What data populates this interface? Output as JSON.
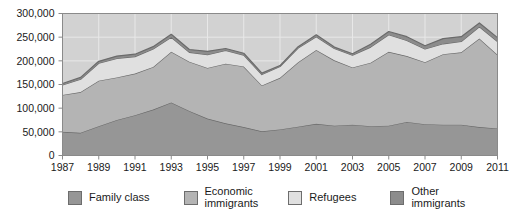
{
  "chart_data": {
    "type": "area",
    "stacked": true,
    "title": "",
    "xlabel": "",
    "ylabel": "",
    "grid": true,
    "legend_position": "bottom",
    "xlim": [
      1987,
      2011
    ],
    "ylim": [
      0,
      300000
    ],
    "ytick_values": [
      0,
      50000,
      100000,
      150000,
      200000,
      250000,
      300000
    ],
    "ytick_labels": [
      "0",
      "50,000",
      "100,000",
      "150,000",
      "200,000",
      "250,000",
      "300,000"
    ],
    "x": [
      1987,
      1988,
      1989,
      1990,
      1991,
      1992,
      1993,
      1994,
      1995,
      1996,
      1997,
      1998,
      1999,
      2000,
      2001,
      2002,
      2003,
      2004,
      2005,
      2006,
      2007,
      2008,
      2009,
      2010,
      2011
    ],
    "xtick_values": [
      1987,
      1989,
      1991,
      1993,
      1995,
      1997,
      1999,
      2001,
      2003,
      2005,
      2007,
      2009,
      2011
    ],
    "xtick_labels": [
      "1987",
      "1989",
      "1991",
      "1993",
      "1995",
      "1997",
      "1999",
      "2001",
      "2003",
      "2005",
      "2007",
      "2009",
      "2011"
    ],
    "series": [
      {
        "name": "Family class",
        "color": "#969696",
        "values": [
          50000,
          48000,
          62000,
          75000,
          85000,
          97000,
          112000,
          94000,
          78000,
          68000,
          60000,
          51000,
          55000,
          61000,
          67000,
          63000,
          65000,
          62000,
          63000,
          71000,
          66000,
          65000,
          65000,
          60000,
          57000
        ]
      },
      {
        "name": "Economic immigrants",
        "color": "#b4b4b4",
        "values": [
          78000,
          86000,
          96000,
          90000,
          88000,
          90000,
          107000,
          104000,
          107000,
          126000,
          128000,
          97000,
          109000,
          136000,
          156000,
          138000,
          121000,
          134000,
          156000,
          139000,
          131000,
          149000,
          153000,
          187000,
          156000
        ]
      },
      {
        "name": "Refugees",
        "color": "#e0e0e0",
        "values": [
          21000,
          27000,
          37000,
          40000,
          36000,
          38000,
          31000,
          20000,
          28000,
          28000,
          24000,
          23000,
          24000,
          30000,
          28000,
          25000,
          26000,
          33000,
          36000,
          33000,
          28000,
          22000,
          23000,
          25000,
          28000
        ]
      },
      {
        "name": "Other immigrants",
        "color": "#8c8c8c",
        "values": [
          3000,
          4000,
          4000,
          5000,
          5000,
          5000,
          6000,
          6000,
          7000,
          4000,
          4000,
          3000,
          2000,
          3000,
          4000,
          3000,
          3000,
          6000,
          7000,
          8000,
          7000,
          11000,
          10000,
          8000,
          8000
        ]
      }
    ],
    "totals": [
      152000,
      165000,
      199000,
      210000,
      214000,
      230000,
      256000,
      224000,
      220000,
      226000,
      216000,
      174000,
      190000,
      230000,
      255000,
      229000,
      215000,
      235000,
      262000,
      251000,
      232000,
      247000,
      251000,
      280000,
      249000
    ]
  },
  "legend": {
    "items": [
      {
        "label": "Family class",
        "color": "#969696",
        "two_line": false
      },
      {
        "label": "Economic\nimmigrants",
        "color": "#b4b4b4",
        "two_line": true
      },
      {
        "label": "Refugees",
        "color": "#e0e0e0",
        "two_line": false
      },
      {
        "label": "Other\nimmigrants",
        "color": "#8c8c8c",
        "two_line": true
      }
    ]
  },
  "style": {
    "plot_background": "#d2d2d2",
    "grid_color": "#e8e8e8",
    "frame_color": "#8a8a8a",
    "line_color": "#6b6b6b",
    "text_color": "#1a1a1a"
  }
}
